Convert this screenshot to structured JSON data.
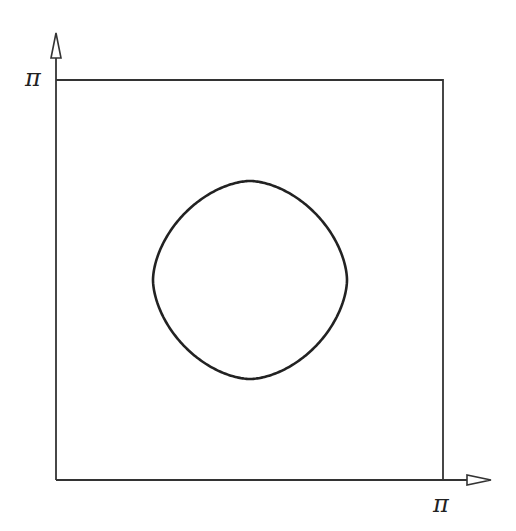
{
  "diagram": {
    "y_axis_label": "π",
    "x_axis_label": "π",
    "colors": {
      "stroke": "#333333",
      "curve": "#222222",
      "background": "#ffffff"
    },
    "elements": [
      "y-axis-arrow",
      "x-axis-arrow",
      "square-boundary",
      "closed-curve"
    ]
  }
}
